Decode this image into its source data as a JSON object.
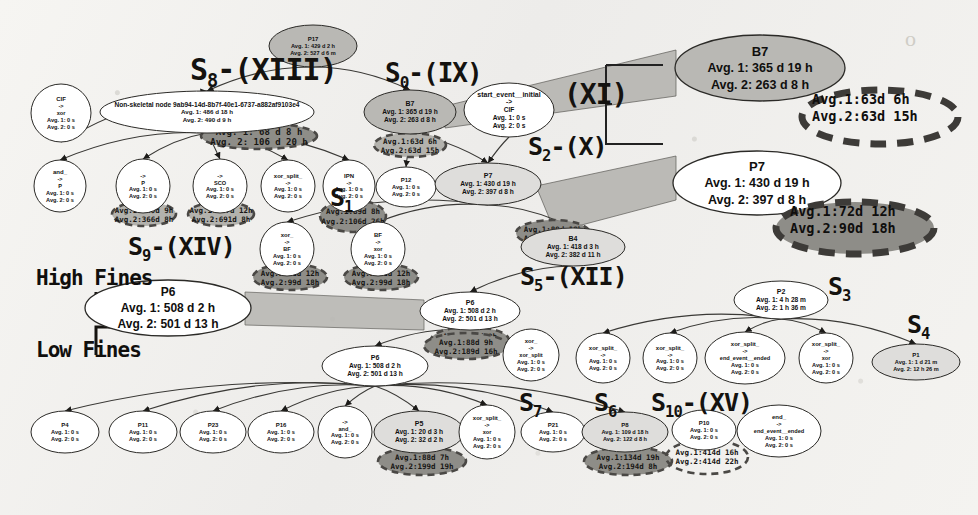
{
  "meta": {
    "background_color": "#f1f0ed",
    "node_fill_light": "#ffffff",
    "node_fill_grey": "#b9b8b4",
    "node_fill_pale": "#dedddb",
    "annotation_fill": "#8e8d88",
    "annotation_fill_light": "#b3b2ad",
    "stroke_color": "#2b2a27"
  },
  "legend": {
    "high_fines": "High Fines",
    "low_fines": "Low Fines"
  },
  "skeleton_labels": [
    {
      "id": "s8",
      "base": "S",
      "sub": "8",
      "suffix": "-(XIII)",
      "x": 190,
      "y": 52,
      "size": 30
    },
    {
      "id": "s0",
      "base": "S",
      "sub": "0",
      "suffix": "-(IX)",
      "x": 385,
      "y": 58,
      "size": 26
    },
    {
      "id": "xi",
      "base": "",
      "sub": "",
      "suffix": "(XI)",
      "x": 564,
      "y": 78,
      "size": 28
    },
    {
      "id": "s2",
      "base": "S",
      "sub": "2",
      "suffix": "-(X)",
      "x": 528,
      "y": 132,
      "size": 25
    },
    {
      "id": "s9",
      "base": "S",
      "sub": "9",
      "suffix": "-(XIV)",
      "x": 128,
      "y": 232,
      "size": 25
    },
    {
      "id": "s1",
      "base": "S",
      "sub": "1",
      "suffix": "",
      "x": 330,
      "y": 183,
      "size": 25
    },
    {
      "id": "s5",
      "base": "S",
      "sub": "5",
      "suffix": "-(XII)",
      "x": 520,
      "y": 262,
      "size": 25
    },
    {
      "id": "s3",
      "base": "S",
      "sub": "3",
      "suffix": "",
      "x": 828,
      "y": 272,
      "size": 25
    },
    {
      "id": "s4",
      "base": "S",
      "sub": "4",
      "suffix": "",
      "x": 907,
      "y": 310,
      "size": 25
    },
    {
      "id": "s7",
      "base": "S",
      "sub": "7",
      "suffix": "",
      "x": 519,
      "y": 388,
      "size": 25
    },
    {
      "id": "s6",
      "base": "S",
      "sub": "6",
      "suffix": "",
      "x": 594,
      "y": 388,
      "size": 25
    },
    {
      "id": "s10",
      "base": "S",
      "sub": "10",
      "suffix": "-(XV)",
      "x": 651,
      "y": 388,
      "size": 25
    }
  ],
  "callouts": [
    {
      "id": "b7-callout",
      "kind": "ellipse",
      "fill": "#b9b8b4",
      "cx": 760,
      "cy": 68,
      "rx": 85,
      "ry": 33,
      "lines": [
        "B7",
        "Avg. 1: 365 d 19 h",
        "Avg. 2: 263 d 8 h"
      ],
      "title_size": 13,
      "line_size": 12.5
    },
    {
      "id": "p7-callout",
      "kind": "ellipse",
      "fill": "#ffffff",
      "cx": 757,
      "cy": 183,
      "rx": 84,
      "ry": 32,
      "lines": [
        "P7",
        "Avg. 1: 430 d 19 h",
        "Avg. 2: 397 d 8 h"
      ],
      "title_size": 13,
      "line_size": 12.5
    },
    {
      "id": "p6-callout",
      "kind": "ellipse",
      "fill": "#ffffff",
      "cx": 168,
      "cy": 308,
      "rx": 83,
      "ry": 28,
      "lines": [
        "P6",
        "Avg. 1: 508 d 2 h",
        "Avg. 2: 501 d 13 h"
      ],
      "title_size": 12,
      "line_size": 12
    }
  ],
  "dashed_callouts": [
    {
      "id": "b7-dashed-annotation",
      "cx": 880,
      "cy": 117,
      "rx": 78,
      "ry": 27,
      "fill": "none",
      "text": "Avg.1:63d  6h\nAvg.2:63d 15h",
      "tx": 812,
      "ty": 104,
      "size": 13.5
    },
    {
      "id": "p7-dashed-annotation",
      "cx": 855,
      "cy": 228,
      "rx": 79,
      "ry": 26,
      "fill": "#8e8d88",
      "text": "Avg.1:72d 12h\nAvg.2:90d 18h",
      "tx": 790,
      "ty": 216,
      "size": 13.5
    }
  ],
  "nodes": [
    {
      "id": "n-p17",
      "cx": 313,
      "cy": 46,
      "rx": 44,
      "ry": 21,
      "fill": "#b9b8b4",
      "lines": [
        "P17",
        "Avg. 1: 429 d 2 h",
        "Avg. 2: 527 d 6 m"
      ]
    },
    {
      "id": "n-cif-top",
      "cx": 61,
      "cy": 113,
      "rx": 30,
      "ry": 29,
      "fill": "#ffffff",
      "lines": [
        "CIF",
        "->",
        "xor",
        "Avg. 1: 0 s",
        "Avg. 2: 0 s"
      ]
    },
    {
      "id": "n-nonskeletal",
      "cx": 207,
      "cy": 112,
      "rx": 107,
      "ry": 21,
      "fill": "#ffffff",
      "lines": [
        "Non-skeletal node 9ab94-14d-8b7f-40e1-6737-a882af9103e4",
        "Avg. 1: 486 d 18 h",
        "Avg. 2: 490 d 9 h"
      ]
    },
    {
      "id": "n-b7",
      "cx": 410,
      "cy": 112,
      "rx": 46,
      "ry": 22,
      "fill": "#b9b8b4",
      "lines": [
        "B7",
        "Avg. 1: 365 d 19 h",
        "Avg. 2: 263 d 8 h"
      ]
    },
    {
      "id": "n-start",
      "cx": 509,
      "cy": 110,
      "rx": 45,
      "ry": 27,
      "fill": "#ffffff",
      "lines": [
        "start_event__initial",
        "->",
        "CIF",
        "Avg. 1: 0 s",
        "Avg. 2: 0 s"
      ]
    },
    {
      "id": "n-and-1",
      "cx": 60,
      "cy": 186,
      "rx": 26,
      "ry": 26,
      "fill": "#ffffff",
      "lines": [
        "and_",
        "->",
        "P",
        "Avg. 1: 0 s",
        "Avg. 2: 0 s"
      ]
    },
    {
      "id": "n-p",
      "cx": 143,
      "cy": 186,
      "rx": 27,
      "ry": 27,
      "fill": "#ffffff",
      "lines": [
        "->",
        "P",
        "Avg. 1: 0 s",
        "Avg. 2: 0 s"
      ]
    },
    {
      "id": "n-sco",
      "cx": 220,
      "cy": 186,
      "rx": 27,
      "ry": 27,
      "fill": "#ffffff",
      "lines": [
        "->",
        "SCO",
        "Avg. 1: 0 s",
        "Avg. 2: 0 s"
      ]
    },
    {
      "id": "n-xorsplit-1",
      "cx": 288,
      "cy": 186,
      "rx": 27,
      "ry": 26,
      "fill": "#ffffff",
      "lines": [
        "xor_split_",
        "->",
        "Avg. 1: 0 s",
        "Avg. 2: 0 s"
      ]
    },
    {
      "id": "n-ipn",
      "cx": 349,
      "cy": 186,
      "rx": 26,
      "ry": 26,
      "fill": "#ffffff",
      "lines": [
        "IPN",
        "->",
        "Avg. 1: 0 s",
        "Avg. 2: 0 s"
      ]
    },
    {
      "id": "n-p12",
      "cx": 406,
      "cy": 187,
      "rx": 30,
      "ry": 20,
      "fill": "#ffffff",
      "lines": [
        "P12",
        "Avg. 1: 0 s",
        "Avg. 2: 0 s"
      ]
    },
    {
      "id": "n-p7",
      "cx": 488,
      "cy": 184,
      "rx": 53,
      "ry": 21,
      "fill": "#dedddb",
      "lines": [
        "P7",
        "Avg. 1: 430 d 19 h",
        "Avg. 2: 397 d 8 h"
      ]
    },
    {
      "id": "n-xor-bf",
      "cx": 287,
      "cy": 249,
      "rx": 27,
      "ry": 27,
      "fill": "#ffffff",
      "lines": [
        "xor_",
        "->",
        "BF",
        "Avg. 1: 0 s",
        "Avg. 2: 0 s"
      ]
    },
    {
      "id": "n-bf-xor",
      "cx": 378,
      "cy": 249,
      "rx": 27,
      "ry": 27,
      "fill": "#ffffff",
      "lines": [
        "BF",
        "->",
        "xor",
        "Avg. 1: 0 s",
        "Avg. 2: 0 s"
      ]
    },
    {
      "id": "n-b4",
      "cx": 573,
      "cy": 247,
      "rx": 52,
      "ry": 19,
      "fill": "#dedddb",
      "lines": [
        "B4",
        "Avg. 1: 418 d 3 h",
        "Avg. 2: 382 d 11 h"
      ]
    },
    {
      "id": "n-p6-main",
      "cx": 470,
      "cy": 311,
      "rx": 50,
      "ry": 19,
      "fill": "#ffffff",
      "lines": [
        "P6",
        "Avg. 1: 508 d 2 h",
        "Avg. 2: 501 d 13 h"
      ]
    },
    {
      "id": "n-p2",
      "cx": 781,
      "cy": 300,
      "rx": 47,
      "ry": 19,
      "fill": "#ffffff",
      "lines": [
        "P2",
        "Avg. 1: 4 h 28 m",
        "Avg. 2: 1 h 36 m"
      ]
    },
    {
      "id": "n-p9",
      "cx": 375,
      "cy": 366,
      "rx": 53,
      "ry": 20,
      "fill": "#ffffff",
      "lines": [
        "P6",
        "Avg. 1: 508 d 2 h",
        "Avg. 2: 501 d 13 h"
      ]
    },
    {
      "id": "n-xor-xorsplit",
      "cx": 531,
      "cy": 355,
      "rx": 28,
      "ry": 26,
      "fill": "#ffffff",
      "lines": [
        "xor_",
        "->",
        "xor_split",
        "Avg. 1: 0 s",
        "Avg. 2: 0 s"
      ]
    },
    {
      "id": "n-xorsplit-2",
      "cx": 603,
      "cy": 358,
      "rx": 27,
      "ry": 25,
      "fill": "#ffffff",
      "lines": [
        "xor_split_",
        "->",
        "Avg. 1: 0 s",
        "Avg. 2: 0 s"
      ]
    },
    {
      "id": "n-xorsplit-3",
      "cx": 670,
      "cy": 358,
      "rx": 27,
      "ry": 25,
      "fill": "#ffffff",
      "lines": [
        "xor_split_",
        "->",
        "Avg. 1: 0 s",
        "Avg. 2: 0 s"
      ]
    },
    {
      "id": "n-endevent-1",
      "cx": 745,
      "cy": 358,
      "rx": 40,
      "ry": 26,
      "fill": "#ffffff",
      "lines": [
        "xor_split_",
        "->",
        "end_event__ended",
        "Avg. 1: 0 s",
        "Avg. 2: 0 s"
      ]
    },
    {
      "id": "n-xorsplit-4",
      "cx": 826,
      "cy": 358,
      "rx": 27,
      "ry": 25,
      "fill": "#ffffff",
      "lines": [
        "xor_split_",
        "->",
        "xor",
        "Avg. 1: 0 s",
        "Avg. 2: 0 s"
      ]
    },
    {
      "id": "n-p1",
      "cx": 916,
      "cy": 362,
      "rx": 44,
      "ry": 18,
      "fill": "#dedddb",
      "lines": [
        "P1",
        "Avg. 1: 1 d 21 m",
        "Avg. 2: 12 h 26 m"
      ]
    },
    {
      "id": "n-p4",
      "cx": 65,
      "cy": 432,
      "rx": 34,
      "ry": 21,
      "fill": "#ffffff",
      "lines": [
        "P4",
        "Avg. 1: 0 s",
        "Avg. 2: 0 s"
      ]
    },
    {
      "id": "n-p11",
      "cx": 143,
      "cy": 432,
      "rx": 34,
      "ry": 21,
      "fill": "#ffffff",
      "lines": [
        "P11",
        "Avg. 1: 0 s",
        "Avg. 2: 0 s"
      ]
    },
    {
      "id": "n-p23",
      "cx": 213,
      "cy": 432,
      "rx": 33,
      "ry": 21,
      "fill": "#ffffff",
      "lines": [
        "P23",
        "Avg. 1: 0 s",
        "Avg. 2: 0 s"
      ]
    },
    {
      "id": "n-p16",
      "cx": 281,
      "cy": 432,
      "rx": 33,
      "ry": 21,
      "fill": "#ffffff",
      "lines": [
        "P16",
        "Avg. 1: 0 s",
        "Avg. 2: 0 s"
      ]
    },
    {
      "id": "n-and-2",
      "cx": 345,
      "cy": 432,
      "rx": 27,
      "ry": 26,
      "fill": "#ffffff",
      "lines": [
        "->",
        "and_",
        "Avg. 1: 0 s",
        "Avg. 2: 0 s"
      ]
    },
    {
      "id": "n-p5",
      "cx": 419,
      "cy": 432,
      "rx": 45,
      "ry": 21,
      "fill": "#dedddb",
      "lines": [
        "P5",
        "Avg. 1: 20 d 3 h",
        "Avg. 2: 32 d 2 h"
      ]
    },
    {
      "id": "n-xor-node",
      "cx": 487,
      "cy": 432,
      "rx": 28,
      "ry": 27,
      "fill": "#ffffff",
      "lines": [
        "xor_split_",
        "->",
        "xor",
        "Avg. 1: 0 s",
        "Avg. 2: 0 s"
      ]
    },
    {
      "id": "n-p21",
      "cx": 553,
      "cy": 432,
      "rx": 32,
      "ry": 20,
      "fill": "#ffffff",
      "lines": [
        "P21",
        "Avg. 1: 0 s",
        "Avg. 2: 0 s"
      ]
    },
    {
      "id": "n-p8",
      "cx": 625,
      "cy": 432,
      "rx": 43,
      "ry": 20,
      "fill": "#dedddb",
      "lines": [
        "P8",
        "Avg. 1: 109 d 18 h",
        "Avg. 2: 122 d 8 h"
      ]
    },
    {
      "id": "n-p10",
      "cx": 704,
      "cy": 430,
      "rx": 32,
      "ry": 20,
      "fill": "#ffffff",
      "lines": [
        "P10",
        "Avg. 1: 0 s",
        "Avg. 2: 0 s"
      ]
    },
    {
      "id": "n-endevent-2",
      "cx": 779,
      "cy": 431,
      "rx": 42,
      "ry": 26,
      "fill": "#ffffff",
      "lines": [
        "end_",
        "->",
        "end_event__ended",
        "Avg. 1: 0 s",
        "Avg. 2: 0 s"
      ]
    }
  ],
  "grey_annotations": [
    {
      "id": "ann-nonskeletal",
      "cx": 259,
      "cy": 136,
      "rx": 58,
      "ry": 13,
      "fill": "#8e8d88",
      "dashed": true,
      "lines": [
        "Avg. 1: 68 d 8 h",
        "Avg. 2: 106 d 20 h"
      ],
      "size": 9
    },
    {
      "id": "ann-p",
      "cx": 144,
      "cy": 214,
      "rx": 32,
      "ry": 12,
      "fill": "#b3b2ad",
      "dashed": true,
      "lines": [
        "Avg.1:339d  9h",
        "Avg.2:366d  8h"
      ],
      "size": 7.5
    },
    {
      "id": "ann-sco",
      "cx": 221,
      "cy": 214,
      "rx": 33,
      "ry": 12,
      "fill": "#b3b2ad",
      "dashed": true,
      "lines": [
        "Avg.1:687d 12h",
        "Avg.2:691d  8h"
      ],
      "size": 7.5
    },
    {
      "id": "ann-ipn",
      "cx": 353,
      "cy": 216,
      "rx": 33,
      "ry": 16,
      "fill": "#8e8d88",
      "dashed": true,
      "lines": [
        "Avg.1:89d   8h",
        "Avg.2:106d 26h"
      ],
      "size": 7.5
    },
    {
      "id": "ann-b7-node",
      "cx": 410,
      "cy": 145,
      "rx": 36,
      "ry": 12,
      "fill": "#b3b2ad",
      "dashed": true,
      "lines": [
        "Avg.1:63d  6h",
        "Avg.2:63d 15h"
      ],
      "size": 7.5
    },
    {
      "id": "ann-xorbf",
      "cx": 290,
      "cy": 277,
      "rx": 37,
      "ry": 13,
      "fill": "#8e8d88",
      "dashed": true,
      "lines": [
        "Avg.1:72d 12h",
        "Avg.2:99d 18h"
      ],
      "size": 7.5
    },
    {
      "id": "ann-bfxor",
      "cx": 381,
      "cy": 277,
      "rx": 37,
      "ry": 13,
      "fill": "#8e8d88",
      "dashed": true,
      "lines": [
        "Avg.1:72d 12h",
        "Avg.2:99d 18h"
      ],
      "size": 7.5
    },
    {
      "id": "ann-p12",
      "cx": 553,
      "cy": 233,
      "rx": 37,
      "ry": 13,
      "fill": "#8e8d88",
      "dashed": true,
      "lines": [
        "Avg.1:89d 18h",
        "Avg.2:187d 8h"
      ],
      "size": 7.5
    },
    {
      "id": "ann-p6",
      "cx": 470,
      "cy": 340,
      "rx": 39,
      "ry": 13,
      "fill": "#8e8d88",
      "dashed": true,
      "lines": [
        "Avg.1:88d  9h",
        "Avg.2:188d 28h"
      ],
      "size": 7.5
    },
    {
      "id": "ann-p9",
      "cx": 466,
      "cy": 346,
      "rx": 42,
      "ry": 13,
      "fill": "#8e8d88",
      "dashed": true,
      "lines": [
        "Avg.1:88d  9h",
        "Avg.2:189d 16h"
      ],
      "size": 7.5
    },
    {
      "id": "ann-p5",
      "cx": 422,
      "cy": 461,
      "rx": 44,
      "ry": 14,
      "fill": "#8e8d88",
      "dashed": true,
      "lines": [
        "Avg.1:88d  7h",
        "Avg.2:199d 19h"
      ],
      "size": 7.5
    },
    {
      "id": "ann-p8",
      "cx": 628,
      "cy": 461,
      "rx": 44,
      "ry": 14,
      "fill": "#8e8d88",
      "dashed": true,
      "lines": [
        "Avg.1:134d 19h",
        "Avg.2:194d  8h"
      ],
      "size": 7.5
    },
    {
      "id": "ann-p10",
      "cx": 707,
      "cy": 457,
      "rx": 41,
      "ry": 17,
      "fill": "none",
      "dashed": true,
      "lines": [
        "Avg.1:414d 16h",
        "Avg.2:414d 22h"
      ],
      "size": 7.5
    }
  ],
  "edges": [
    {
      "from": "n-p17",
      "to": "n-nonskeletal"
    },
    {
      "from": "n-p17",
      "to": "n-b7"
    },
    {
      "from": "n-cif-top",
      "to": "n-nonskeletal"
    },
    {
      "from": "n-nonskeletal",
      "to": "n-and-1"
    },
    {
      "from": "n-nonskeletal",
      "to": "n-p"
    },
    {
      "from": "n-nonskeletal",
      "to": "n-sco"
    },
    {
      "from": "n-nonskeletal",
      "to": "n-xorsplit-1"
    },
    {
      "from": "n-nonskeletal",
      "to": "n-ipn"
    },
    {
      "from": "n-b7",
      "to": "n-p12"
    },
    {
      "from": "n-start",
      "to": "n-p7"
    },
    {
      "from": "n-b7",
      "to": "n-p7"
    },
    {
      "from": "n-p7",
      "to": "n-xor-bf"
    },
    {
      "from": "n-p7",
      "to": "n-bf-xor"
    },
    {
      "from": "n-p7",
      "to": "n-b4"
    },
    {
      "from": "n-b4",
      "to": "n-p6-main"
    },
    {
      "from": "n-p6-main",
      "to": "n-p9"
    },
    {
      "from": "n-p2",
      "to": "n-xorsplit-2"
    },
    {
      "from": "n-p2",
      "to": "n-xorsplit-3"
    },
    {
      "from": "n-p2",
      "to": "n-endevent-1"
    },
    {
      "from": "n-p2",
      "to": "n-xorsplit-4"
    },
    {
      "from": "n-p2",
      "to": "n-p1"
    },
    {
      "from": "n-p9",
      "to": "n-p4"
    },
    {
      "from": "n-p9",
      "to": "n-p11"
    },
    {
      "from": "n-p9",
      "to": "n-p23"
    },
    {
      "from": "n-p9",
      "to": "n-p16"
    },
    {
      "from": "n-p9",
      "to": "n-and-2"
    },
    {
      "from": "n-p9",
      "to": "n-p5"
    },
    {
      "from": "n-p9",
      "to": "n-xor-node"
    },
    {
      "from": "n-p9",
      "to": "n-p21"
    },
    {
      "from": "n-p9",
      "to": "n-p8"
    }
  ]
}
